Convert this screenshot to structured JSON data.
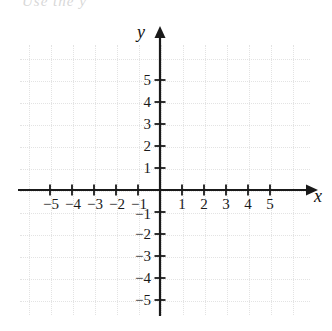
{
  "figure": {
    "type": "coordinate-grid",
    "top_text_remnant": "Use the   y",
    "background_color": "#ffffff",
    "axis_color": "#1a1a1a",
    "grid_color": "#e3e3e3"
  },
  "axes": {
    "x_axis_label": "x",
    "y_axis_label": "y",
    "x_arrow": "right-arrowhead",
    "y_arrow": "up-arrowhead"
  },
  "chart_data": {
    "type": "scatter",
    "title": "",
    "xlabel": "x",
    "ylabel": "y",
    "xlim": [
      -6.4,
      6.8
    ],
    "ylim": [
      -6.6,
      6.6
    ],
    "xticks": [
      -5,
      -4,
      -3,
      -2,
      -1,
      1,
      2,
      3,
      4,
      5
    ],
    "yticks": [
      5,
      4,
      3,
      2,
      1,
      -1,
      -2,
      -3,
      -4,
      -5
    ],
    "xtick_labels": [
      "−5",
      "−4",
      "−3",
      "−2",
      "−1",
      "1",
      "2",
      "3",
      "4",
      "5"
    ],
    "ytick_labels": [
      "5",
      "4",
      "3",
      "2",
      "1",
      "−1",
      "−2",
      "−3",
      "−4",
      "−5"
    ],
    "grid": true,
    "grid_style": "dotted",
    "legend": null,
    "series": [],
    "x": [],
    "values": [],
    "annotations": []
  }
}
